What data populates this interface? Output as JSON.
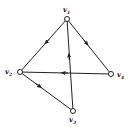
{
  "diagram": {
    "type": "directed-graph",
    "vertices": [
      {
        "id": "v1",
        "label": "v",
        "sub": "1",
        "x": 67,
        "y": 19
      },
      {
        "id": "v2",
        "label": "v",
        "sub": "2",
        "x": 20,
        "y": 72
      },
      {
        "id": "v3",
        "label": "v",
        "sub": "3",
        "x": 73,
        "y": 111
      },
      {
        "id": "v4",
        "label": "v",
        "sub": "4",
        "x": 111,
        "y": 74
      }
    ],
    "edges": [
      {
        "from": "v1",
        "to": "v2"
      },
      {
        "from": "v1",
        "to": "v4"
      },
      {
        "from": "v3",
        "to": "v1"
      },
      {
        "from": "v4",
        "to": "v2"
      },
      {
        "from": "v2",
        "to": "v3"
      }
    ],
    "colors": {
      "stroke": "#222222",
      "background": "#ffffff"
    }
  }
}
